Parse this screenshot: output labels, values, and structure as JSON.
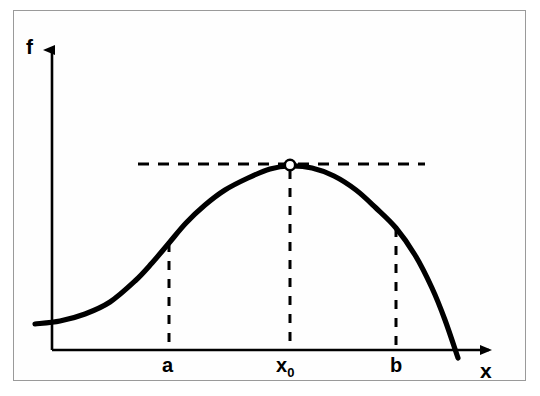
{
  "figure": {
    "background_color": "#ffffff",
    "border_color": "#9a9a9a",
    "ink_color": "#000000"
  },
  "axes": {
    "y_axis_label": "f",
    "x_axis_label": "x",
    "origin": {
      "x": 52,
      "y": 350
    },
    "y_axis_top": {
      "x": 52,
      "y": 47
    },
    "x_axis_right": {
      "x": 495,
      "y": 350
    },
    "arrow_heads": [
      "y-axis-up",
      "x-axis-right"
    ]
  },
  "tick_labels": [
    {
      "name": "a",
      "text": "a",
      "x": 169
    },
    {
      "name": "x0",
      "text": "x",
      "subscript": "0",
      "x": 290
    },
    {
      "name": "b",
      "text": "b",
      "x": 396
    }
  ],
  "markers": {
    "maximum_point": {
      "label": "open-circle-at-maximum",
      "x": 290,
      "y": 165,
      "style": "open circle, white fill, black outline"
    }
  },
  "guide_lines": {
    "horizontal_dashed": {
      "label": "maximum-value-level",
      "y": 164,
      "x_start": 138,
      "x_end": 425,
      "style": "dashed"
    },
    "vertical_dashed": [
      {
        "label": "a",
        "x": 169,
        "y_top": 243,
        "y_bottom": 350
      },
      {
        "label": "x0",
        "x": 290,
        "y_top": 168,
        "y_bottom": 350
      },
      {
        "label": "b",
        "x": 396,
        "y_top": 228,
        "y_bottom": 350
      }
    ]
  },
  "chart_data": {
    "type": "line",
    "title": "",
    "xlabel": "x",
    "ylabel": "f",
    "grid": false,
    "legend": null,
    "annotations": [
      {
        "text": "a",
        "type": "x-tick"
      },
      {
        "text": "x",
        "subscript": "0",
        "type": "x-tick"
      },
      {
        "text": "b",
        "type": "x-tick"
      }
    ],
    "series": [
      {
        "name": "f",
        "comment": "Curve in pixel coordinates; y increases downward in image space.",
        "points": [
          [
            35,
            324
          ],
          [
            60,
            321
          ],
          [
            85,
            314
          ],
          [
            110,
            302
          ],
          [
            135,
            281
          ],
          [
            152,
            263
          ],
          [
            169,
            243
          ],
          [
            186,
            223
          ],
          [
            205,
            205
          ],
          [
            225,
            190
          ],
          [
            248,
            178
          ],
          [
            270,
            169
          ],
          [
            290,
            166
          ],
          [
            312,
            168
          ],
          [
            334,
            176
          ],
          [
            356,
            190
          ],
          [
            376,
            208
          ],
          [
            396,
            228
          ],
          [
            415,
            255
          ],
          [
            432,
            288
          ],
          [
            445,
            320
          ],
          [
            458,
            358
          ]
        ]
      }
    ]
  }
}
